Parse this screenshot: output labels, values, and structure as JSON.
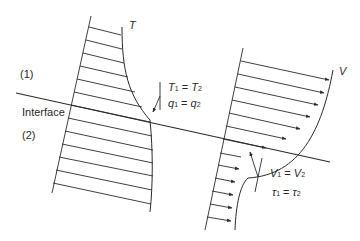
{
  "diagram": {
    "interface_label": "Interface",
    "region_top_label": "(1)",
    "region_bottom_label": "(2)",
    "temperature_profile": {
      "curve_label": "T",
      "condition_1": {
        "lhs": "T",
        "lhs_sub": "1",
        "op": " = ",
        "rhs": "T",
        "rhs_sub": "2"
      },
      "condition_2": {
        "lhs": "q",
        "lhs_sub": "1",
        "op": " = ",
        "rhs": "q",
        "rhs_sub": "2"
      }
    },
    "velocity_profile": {
      "curve_label": "V",
      "condition_1": {
        "lhs": "V",
        "lhs_sub": "1",
        "op": " = ",
        "rhs": "V",
        "rhs_sub": "2"
      },
      "condition_2": {
        "lhs": "τ",
        "lhs_sub": "1",
        "op": " = ",
        "rhs": "τ",
        "rhs_sub": "2"
      }
    },
    "colors": {
      "stroke": "#2a2a2a",
      "background": "#ffffff"
    }
  }
}
